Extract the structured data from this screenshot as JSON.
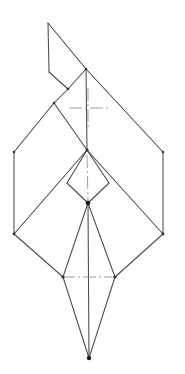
{
  "document": {
    "title": "Origami Fold Diagram",
    "kind": "line-drawing",
    "background_color": "#ffffff",
    "line_color": "#4a4a4a",
    "crease_color": "#8d8d8d",
    "node_color": "#1d1d1d",
    "width": 185,
    "height": 374
  },
  "figure": {
    "name": "folded-paper-crane-outline",
    "points": {
      "flap_apex": [
        48,
        23
      ],
      "flap_lower_left": [
        49,
        72
      ],
      "flap_fold_node": [
        68,
        89
      ],
      "upper_left_node": [
        54,
        103
      ],
      "upper_diamond_top": [
        86,
        69
      ],
      "diamond_left": [
        14,
        152
      ],
      "diamond_right": [
        163,
        152
      ],
      "center_cross": [
        87,
        150
      ],
      "small_diamond_left": [
        67,
        183
      ],
      "small_diamond_right": [
        109,
        183
      ],
      "hub": [
        88,
        203
      ],
      "lower_left": [
        14,
        234
      ],
      "lower_right": [
        163,
        234
      ],
      "wing_left": [
        63,
        277
      ],
      "wing_right": [
        115,
        277
      ],
      "tail_tip": [
        89,
        358
      ]
    },
    "edges": [
      {
        "name": "flap-left-vertical",
        "from": "flap_apex",
        "to": "flap_lower_left"
      },
      {
        "name": "flap-diagonal-right",
        "from": "flap_apex",
        "to": "upper_diamond_top"
      },
      {
        "name": "flap-lower-diagonal",
        "from": "flap_lower_left",
        "to": "flap_fold_node"
      },
      {
        "name": "flap-fold-to-top",
        "from": "flap_fold_node",
        "to": "upper_diamond_top"
      },
      {
        "name": "upper-left-edge",
        "from": "flap_fold_node",
        "to": "upper_left_node"
      },
      {
        "name": "diamond-upper-left",
        "from": "upper_left_node",
        "to": "diamond_left"
      },
      {
        "name": "diamond-upper-right",
        "from": "upper_diamond_top",
        "to": "diamond_right"
      },
      {
        "name": "inner-left-crease",
        "from": "upper_left_node",
        "to": "center_cross"
      },
      {
        "name": "inner-right-crease",
        "from": "upper_diamond_top",
        "to": "center_cross"
      },
      {
        "name": "diamond-left-vertical",
        "from": "diamond_left",
        "to": "lower_left"
      },
      {
        "name": "diamond-right-vertical",
        "from": "diamond_right",
        "to": "lower_right"
      },
      {
        "name": "lower-left-diagonal",
        "from": "center_cross",
        "to": "lower_left"
      },
      {
        "name": "lower-right-diagonal",
        "from": "center_cross",
        "to": "lower_right"
      },
      {
        "name": "small-diamond-left-upper",
        "from": "center_cross",
        "to": "small_diamond_left"
      },
      {
        "name": "small-diamond-right-upper",
        "from": "center_cross",
        "to": "small_diamond_right"
      },
      {
        "name": "small-diamond-left-lower",
        "from": "small_diamond_left",
        "to": "hub"
      },
      {
        "name": "small-diamond-right-lower",
        "from": "small_diamond_right",
        "to": "hub"
      },
      {
        "name": "wing-left-upper",
        "from": "hub",
        "to": "wing_left"
      },
      {
        "name": "wing-right-upper",
        "from": "hub",
        "to": "wing_right"
      },
      {
        "name": "wing-left-from-corner",
        "from": "lower_left",
        "to": "wing_left"
      },
      {
        "name": "wing-right-from-corner",
        "from": "lower_right",
        "to": "wing_right"
      },
      {
        "name": "tail-left",
        "from": "wing_left",
        "to": "tail_tip"
      },
      {
        "name": "tail-right",
        "from": "wing_right",
        "to": "tail_tip"
      },
      {
        "name": "tail-spine",
        "from": "hub",
        "to": "tail_tip"
      }
    ],
    "creases": [
      {
        "name": "upper-crosshair-horizontal",
        "x1": 69,
        "y1": 108,
        "x2": 108,
        "y2": 108
      },
      {
        "name": "upper-crosshair-vertical",
        "x1": 88,
        "y1": 88,
        "x2": 88,
        "y2": 128
      },
      {
        "name": "center-vertical-crease",
        "x1": 87,
        "y1": 155,
        "x2": 88,
        "y2": 200
      },
      {
        "name": "lower-crosshair-horizontal",
        "x1": 62,
        "y1": 277,
        "x2": 116,
        "y2": 277
      }
    ],
    "nodes": [
      {
        "name": "hub-node",
        "at": "hub",
        "radius": 2.4
      },
      {
        "name": "tail-tip-node",
        "at": "tail_tip",
        "radius": 2.2
      },
      {
        "name": "center-cross-node",
        "at": "center_cross",
        "radius": 1.5
      },
      {
        "name": "flap-fold-node",
        "at": "flap_fold_node",
        "radius": 1.3
      },
      {
        "name": "upper-left-node",
        "at": "upper_left_node",
        "radius": 1.3
      },
      {
        "name": "wing-left-node",
        "at": "wing_left",
        "radius": 1.5
      },
      {
        "name": "wing-right-node",
        "at": "wing_right",
        "radius": 1.5
      },
      {
        "name": "diamond-left-node",
        "at": "diamond_left",
        "radius": 1.2
      },
      {
        "name": "diamond-right-node",
        "at": "diamond_right",
        "radius": 1.2
      },
      {
        "name": "lower-left-node",
        "at": "lower_left",
        "radius": 1.4
      },
      {
        "name": "lower-right-node",
        "at": "lower_right",
        "radius": 1.4
      },
      {
        "name": "upper-diamond-top-node",
        "at": "upper_diamond_top",
        "radius": 1.3
      }
    ]
  }
}
